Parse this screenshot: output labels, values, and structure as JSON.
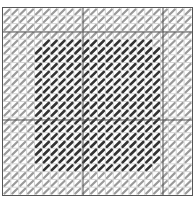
{
  "diagram": {
    "type": "needlepoint-stitch-chart",
    "grid": {
      "cols": 24,
      "rows": 24,
      "cell_px": 8
    },
    "major_lines": {
      "x": [
        80,
        160
      ],
      "y": [
        24,
        112
      ]
    },
    "colors": {
      "background": "#ffffff",
      "grid_line": "#bbbbbb",
      "major_line": "#555555",
      "border": "#555555",
      "light_stitch": "#9a9a9a",
      "dark_stitch": "#333333"
    },
    "regions": [
      {
        "name": "background-stitches",
        "color_key": "light_stitch",
        "fill": "all"
      },
      {
        "name": "center-block",
        "color_key": "dark_stitch",
        "col_start": 4,
        "col_end": 20,
        "row_start": 4,
        "row_end": 21,
        "corner_cut": 2
      }
    ]
  }
}
